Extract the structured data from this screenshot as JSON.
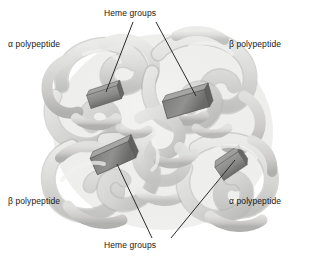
{
  "figure": {
    "background_color": "#ffffff"
  },
  "labels": {
    "heme_top": "Heme groups",
    "heme_bottom": "Heme groups",
    "alpha_top_left": "α polypeptide",
    "beta_top_right": "β polypeptide",
    "beta_bottom_left": "β polypeptide",
    "alpha_bottom_right": "α polypeptide"
  },
  "colors": {
    "background": "#ffffff",
    "text": "#171717",
    "leader_line": "#2b2b2b",
    "ribbon_light": "#e4e4e2",
    "ribbon_mid": "#d2d2d0",
    "ribbon_shadow": "#bdbdbb",
    "ribbon_dark": "#a9a9a7",
    "heme_fill": "#8a8a88",
    "heme_dark": "#6e6e6c",
    "heme_light": "#9e9e9c",
    "heme_edge": "#5a5a58"
  },
  "subunits": [
    {
      "name": "alpha polypeptide",
      "position": "top-left"
    },
    {
      "name": "beta polypeptide",
      "position": "top-right"
    },
    {
      "name": "beta polypeptide",
      "position": "bottom-left"
    },
    {
      "name": "alpha polypeptide",
      "position": "bottom-right"
    }
  ],
  "heme_groups": [
    {
      "id": "heme-top-left",
      "x": 104,
      "y": 97,
      "rotation": -18
    },
    {
      "id": "heme-top-right",
      "x": 185,
      "y": 104,
      "rotation": -16
    },
    {
      "id": "heme-bottom-left",
      "x": 113,
      "y": 158,
      "rotation": -24
    },
    {
      "id": "heme-bottom-right",
      "x": 231,
      "y": 166,
      "rotation": -34
    }
  ],
  "leader_lines": [
    {
      "from_label": "heme_top",
      "to_heme": "heme-top-left"
    },
    {
      "from_label": "heme_top",
      "to_heme": "heme-top-right"
    },
    {
      "from_label": "heme_bottom",
      "to_heme": "heme-bottom-left"
    },
    {
      "from_label": "heme_bottom",
      "to_heme": "heme-bottom-right"
    }
  ]
}
